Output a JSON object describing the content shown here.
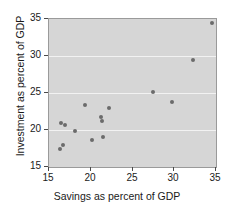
{
  "chart_data": {
    "type": "scatter",
    "title": "",
    "xlabel": "Savings as percent of GDP",
    "ylabel": "Investment as percent of GDP",
    "xlim": [
      15,
      35
    ],
    "ylim": [
      15,
      35
    ],
    "xticks": [
      15,
      20,
      25,
      30,
      35
    ],
    "yticks": [
      15,
      20,
      25,
      30,
      35
    ],
    "xtick_labels": [
      "15",
      "20",
      "25",
      "30",
      "35"
    ],
    "ytick_labels": [
      "15",
      "20",
      "25",
      "30",
      "35"
    ],
    "grid": true,
    "grid_axis": "y",
    "legend": null,
    "marker_color": "#6b6b6b",
    "panel_color": "#d6d6d6",
    "gridline_color": "#f2f2f2",
    "points": [
      {
        "x": 16.3,
        "y": 17.5
      },
      {
        "x": 16.7,
        "y": 18.0
      },
      {
        "x": 16.4,
        "y": 21.0
      },
      {
        "x": 16.9,
        "y": 20.7
      },
      {
        "x": 18.1,
        "y": 19.8
      },
      {
        "x": 19.3,
        "y": 23.4
      },
      {
        "x": 20.1,
        "y": 18.6
      },
      {
        "x": 21.2,
        "y": 21.7
      },
      {
        "x": 21.4,
        "y": 21.2
      },
      {
        "x": 21.5,
        "y": 19.0
      },
      {
        "x": 22.2,
        "y": 23.0
      },
      {
        "x": 27.4,
        "y": 25.2
      },
      {
        "x": 29.7,
        "y": 23.8
      },
      {
        "x": 32.2,
        "y": 29.5
      },
      {
        "x": 34.5,
        "y": 34.4
      }
    ]
  }
}
